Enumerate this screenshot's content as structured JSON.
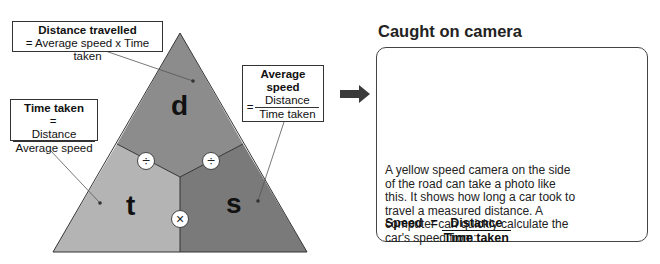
{
  "triangle": {
    "top_letter": "d",
    "left_letter": "t",
    "right_letter": "s",
    "op_left": "÷",
    "op_right": "÷",
    "op_bottom": "×",
    "colors": {
      "top": "#8c8c8c",
      "left": "#b4b4b4",
      "right": "#7a7a7a"
    }
  },
  "labels": {
    "distance": {
      "title": "Distance travelled",
      "formula": "= Average speed x Time taken"
    },
    "time": {
      "title": "Time taken",
      "eq": "=",
      "numerator": "Distance",
      "denominator": "Average speed"
    },
    "speed": {
      "title_line1": "Average",
      "title_line2": "speed",
      "eq": "=",
      "numerator": "Distance",
      "denominator": "Time taken"
    }
  },
  "camera": {
    "heading": "Caught on camera",
    "description": "A yellow speed camera on the side of the road can take a photo like this. It shows how long a car took to travel a measured distance. A computer can quickly calculate the car's speed from:",
    "formula": {
      "lhs": "Speed",
      "eq": "=",
      "numerator": "Distance",
      "denominator": "Time taken"
    },
    "fine": {
      "line1": "SPEEDING",
      "line2": "FINE!",
      "line3": "£200"
    }
  }
}
